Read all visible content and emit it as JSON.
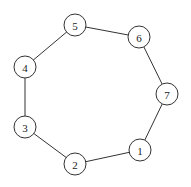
{
  "diagram": {
    "type": "cycle-graph",
    "node_radius": 11,
    "colors": {
      "stroke": "#333333",
      "fill": "#ffffff",
      "text": "#222222",
      "background": "#ffffff"
    },
    "nodes": [
      {
        "id": "1",
        "label": "1",
        "x": 140,
        "y": 150
      },
      {
        "id": "2",
        "label": "2",
        "x": 75,
        "y": 164
      },
      {
        "id": "3",
        "label": "3",
        "x": 25,
        "y": 127
      },
      {
        "id": "4",
        "label": "4",
        "x": 25,
        "y": 67
      },
      {
        "id": "5",
        "label": "5",
        "x": 75,
        "y": 25
      },
      {
        "id": "6",
        "label": "6",
        "x": 139,
        "y": 37
      },
      {
        "id": "7",
        "label": "7",
        "x": 167,
        "y": 94
      }
    ],
    "edges": [
      {
        "from": "1",
        "to": "2"
      },
      {
        "from": "2",
        "to": "3"
      },
      {
        "from": "3",
        "to": "4"
      },
      {
        "from": "4",
        "to": "5"
      },
      {
        "from": "5",
        "to": "6"
      },
      {
        "from": "6",
        "to": "7"
      },
      {
        "from": "7",
        "to": "1"
      }
    ]
  }
}
